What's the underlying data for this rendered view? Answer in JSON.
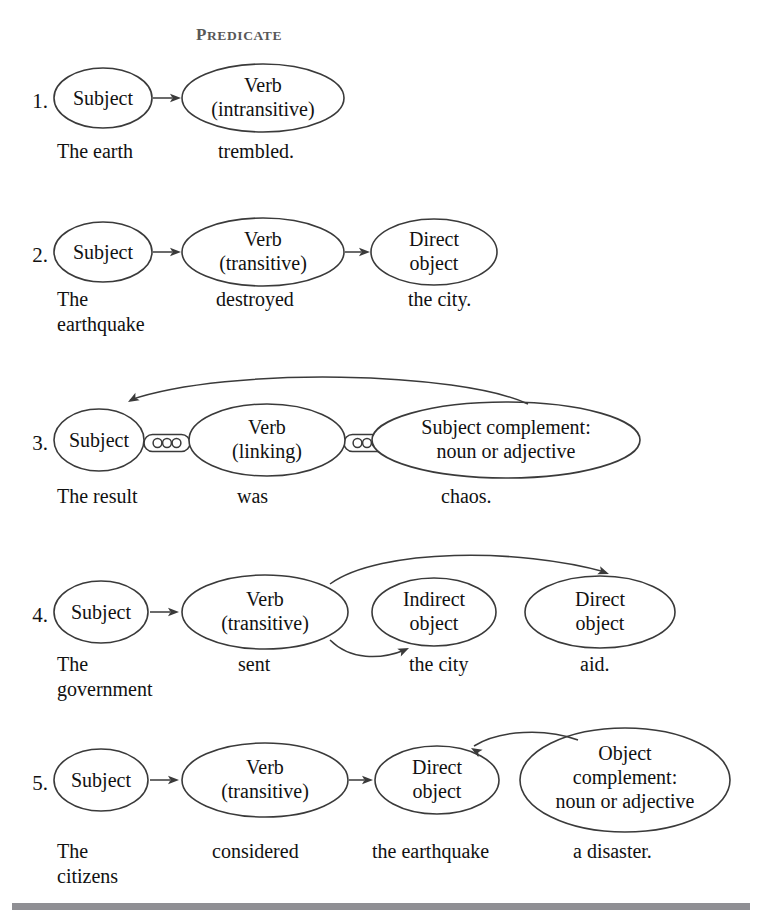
{
  "figure": {
    "header": {
      "label": "PREDICATE",
      "first_letter": "P",
      "rest_letters": "REDICATE",
      "x": 196,
      "y": 40
    },
    "colors": {
      "background": "#ffffff",
      "stroke": "#3a3a3a",
      "text": "#111111",
      "header_text": "#585858",
      "rule": "#8f8f94"
    },
    "bottom_rule": {
      "x": 12,
      "y": 903,
      "width": 738,
      "height": 7
    }
  },
  "rows": [
    {
      "id": "row-1",
      "number": "1.",
      "number_x": 48,
      "number_y": 108,
      "nodes": [
        {
          "name": "subject",
          "lines": [
            "Subject"
          ],
          "cx": 103,
          "cy": 98,
          "rx": 49,
          "ry": 30,
          "text_y": [
            105
          ]
        },
        {
          "name": "verb-intransitive",
          "lines": [
            "Verb",
            "(intransitive)"
          ],
          "cx": 263,
          "cy": 98,
          "rx": 81,
          "ry": 34,
          "text_y": [
            92,
            116
          ]
        }
      ],
      "arrows": [
        {
          "name": "subject-to-verb",
          "type": "straight",
          "x1": 153,
          "y1": 98,
          "x2": 181,
          "y2": 98
        }
      ],
      "curves": [],
      "links": [],
      "captions": [
        {
          "name": "caption-subject",
          "lines": [
            "The earth"
          ],
          "x": 57,
          "y": 158
        },
        {
          "name": "caption-verb",
          "lines": [
            "trembled."
          ],
          "x": 218,
          "y": 158
        }
      ]
    },
    {
      "id": "row-2",
      "number": "2.",
      "number_x": 48,
      "number_y": 262,
      "nodes": [
        {
          "name": "subject",
          "lines": [
            "Subject"
          ],
          "cx": 103,
          "cy": 252,
          "rx": 49,
          "ry": 30,
          "text_y": [
            259
          ]
        },
        {
          "name": "verb-transitive",
          "lines": [
            "Verb",
            "(transitive)"
          ],
          "cx": 263,
          "cy": 252,
          "rx": 81,
          "ry": 34,
          "text_y": [
            246,
            270
          ]
        },
        {
          "name": "direct-object",
          "lines": [
            "Direct",
            "object"
          ],
          "cx": 434,
          "cy": 252,
          "rx": 63,
          "ry": 33,
          "text_y": [
            246,
            270
          ]
        }
      ],
      "arrows": [
        {
          "name": "subject-to-verb",
          "type": "straight",
          "x1": 153,
          "y1": 252,
          "x2": 181,
          "y2": 252
        },
        {
          "name": "verb-to-object",
          "type": "straight",
          "x1": 345,
          "y1": 252,
          "x2": 370,
          "y2": 252
        }
      ],
      "curves": [],
      "links": [],
      "captions": [
        {
          "name": "caption-subject",
          "lines": [
            "The",
            "earthquake"
          ],
          "x": 57,
          "y": 306
        },
        {
          "name": "caption-verb",
          "lines": [
            "destroyed"
          ],
          "x": 216,
          "y": 306
        },
        {
          "name": "caption-object",
          "lines": [
            "the city."
          ],
          "x": 408,
          "y": 306
        }
      ]
    },
    {
      "id": "row-3",
      "number": "3.",
      "number_x": 48,
      "number_y": 450,
      "nodes": [
        {
          "name": "subject",
          "lines": [
            "Subject"
          ],
          "cx": 99,
          "cy": 440,
          "rx": 45,
          "ry": 31,
          "text_y": [
            447
          ]
        },
        {
          "name": "verb-linking",
          "lines": [
            "Verb",
            "(linking)"
          ],
          "cx": 267,
          "cy": 440,
          "rx": 78,
          "ry": 36,
          "text_y": [
            434,
            458
          ]
        },
        {
          "name": "subject-complement",
          "lines": [
            "Subject complement:",
            "noun or adjective"
          ],
          "cx": 506,
          "cy": 440,
          "rx": 134,
          "ry": 38,
          "text_y": [
            434,
            458
          ]
        }
      ],
      "arrows": [],
      "curves": [
        {
          "name": "complement-to-subject",
          "path": "M 528 404 C 460 372 230 366 130 400",
          "arrow": {
            "x": 128,
            "y": 402,
            "angle": 150
          }
        }
      ],
      "links": [
        {
          "name": "chain-link-subject-verb",
          "cx": 167,
          "cy": 443,
          "w": 46,
          "h": 17
        },
        {
          "name": "chain-link-verb-complement",
          "cx": 367,
          "cy": 443,
          "w": 46,
          "h": 17
        }
      ],
      "captions": [
        {
          "name": "caption-subject",
          "lines": [
            "The result"
          ],
          "x": 57,
          "y": 503
        },
        {
          "name": "caption-verb",
          "lines": [
            "was"
          ],
          "x": 237,
          "y": 503
        },
        {
          "name": "caption-complement",
          "lines": [
            "chaos."
          ],
          "x": 441,
          "y": 503
        }
      ]
    },
    {
      "id": "row-4",
      "number": "4.",
      "number_x": 48,
      "number_y": 622,
      "nodes": [
        {
          "name": "subject",
          "lines": [
            "Subject"
          ],
          "cx": 101,
          "cy": 612,
          "rx": 47,
          "ry": 31,
          "text_y": [
            619
          ]
        },
        {
          "name": "verb-transitive",
          "lines": [
            "Verb",
            "(transitive)"
          ],
          "cx": 265,
          "cy": 612,
          "rx": 83,
          "ry": 37,
          "text_y": [
            606,
            630
          ]
        },
        {
          "name": "indirect-object",
          "lines": [
            "Indirect",
            "object"
          ],
          "cx": 434,
          "cy": 612,
          "rx": 62,
          "ry": 34,
          "text_y": [
            606,
            630
          ]
        },
        {
          "name": "direct-object",
          "lines": [
            "Direct",
            "object"
          ],
          "cx": 600,
          "cy": 612,
          "rx": 75,
          "ry": 36,
          "text_y": [
            606,
            630
          ]
        }
      ],
      "arrows": [
        {
          "name": "subject-to-verb",
          "type": "straight",
          "x1": 150,
          "y1": 612,
          "x2": 179,
          "y2": 612
        }
      ],
      "curves": [
        {
          "name": "verb-to-direct-object",
          "path": "M 330 584 C 380 548 520 548 605 572",
          "arrow": {
            "x": 609,
            "y": 574,
            "angle": 20
          }
        },
        {
          "name": "verb-to-indirect-object",
          "path": "M 330 640 C 350 660 380 660 405 650",
          "arrow": {
            "x": 409,
            "y": 648,
            "angle": -25
          }
        }
      ],
      "links": [],
      "captions": [
        {
          "name": "caption-subject",
          "lines": [
            "The",
            "government"
          ],
          "x": 57,
          "y": 671
        },
        {
          "name": "caption-verb",
          "lines": [
            "sent"
          ],
          "x": 238,
          "y": 671
        },
        {
          "name": "caption-indirect",
          "lines": [
            "the city"
          ],
          "x": 409,
          "y": 671
        },
        {
          "name": "caption-direct",
          "lines": [
            "aid."
          ],
          "x": 580,
          "y": 671
        }
      ]
    },
    {
      "id": "row-5",
      "number": "5.",
      "number_x": 48,
      "number_y": 790,
      "nodes": [
        {
          "name": "subject",
          "lines": [
            "Subject"
          ],
          "cx": 101,
          "cy": 780,
          "rx": 47,
          "ry": 31,
          "text_y": [
            787
          ]
        },
        {
          "name": "verb-transitive",
          "lines": [
            "Verb",
            "(transitive)"
          ],
          "cx": 265,
          "cy": 780,
          "rx": 83,
          "ry": 37,
          "text_y": [
            774,
            798
          ]
        },
        {
          "name": "direct-object",
          "lines": [
            "Direct",
            "object"
          ],
          "cx": 437,
          "cy": 780,
          "rx": 62,
          "ry": 34,
          "text_y": [
            774,
            798
          ]
        },
        {
          "name": "object-complement",
          "lines": [
            "Object",
            "complement:",
            "noun or adjective"
          ],
          "cx": 625,
          "cy": 780,
          "rx": 105,
          "ry": 52,
          "text_y": [
            760,
            784,
            808
          ]
        }
      ],
      "arrows": [
        {
          "name": "subject-to-verb",
          "type": "straight",
          "x1": 150,
          "y1": 780,
          "x2": 179,
          "y2": 780
        },
        {
          "name": "verb-to-direct-object",
          "type": "straight",
          "x1": 349,
          "y1": 780,
          "x2": 373,
          "y2": 780
        }
      ],
      "curves": [
        {
          "name": "complement-to-direct-object",
          "path": "M 578 740 C 545 728 500 730 474 746",
          "arrow": {
            "x": 471,
            "y": 748,
            "angle": 210
          }
        }
      ],
      "links": [],
      "captions": [
        {
          "name": "caption-subject",
          "lines": [
            "The",
            "citizens"
          ],
          "x": 57,
          "y": 858
        },
        {
          "name": "caption-verb",
          "lines": [
            "considered"
          ],
          "x": 212,
          "y": 858
        },
        {
          "name": "caption-direct",
          "lines": [
            "the earthquake"
          ],
          "x": 372,
          "y": 858
        },
        {
          "name": "caption-complement",
          "lines": [
            "a disaster."
          ],
          "x": 573,
          "y": 858
        }
      ]
    }
  ]
}
